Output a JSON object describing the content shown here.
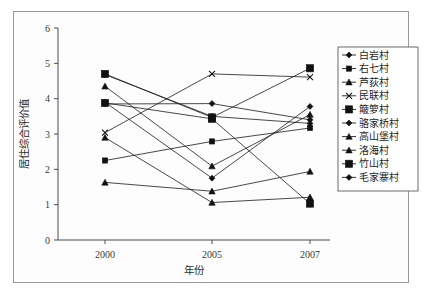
{
  "chart_data": {
    "type": "line",
    "title": "",
    "xlabel": "年份",
    "ylabel": "居住综合评价值",
    "categories": [
      "2000",
      "2005",
      "2007"
    ],
    "x": [
      2000,
      2005,
      2007
    ],
    "xlim": [
      2000,
      2007
    ],
    "ylim": [
      0,
      6
    ],
    "yticks": [
      0,
      1,
      2,
      3,
      4,
      5,
      6
    ],
    "ytick_labels": [
      "0",
      "1",
      "2",
      "3",
      "4",
      "5",
      "6"
    ],
    "grid": false,
    "legend_position": "right",
    "series": [
      {
        "name": "白岩村",
        "marker": "diamond",
        "values": [
          3.85,
          3.86,
          3.4
        ]
      },
      {
        "name": "右七村",
        "marker": "small-square",
        "values": [
          2.25,
          2.79,
          3.17
        ]
      },
      {
        "name": "芦荻村",
        "marker": "triangle",
        "values": [
          4.35,
          2.09,
          3.55
        ]
      },
      {
        "name": "民联村",
        "marker": "cross",
        "values": [
          3.04,
          4.7,
          4.61
        ]
      },
      {
        "name": "簸箩村",
        "marker": "large-square",
        "values": [
          4.7,
          3.47,
          4.86
        ]
      },
      {
        "name": "骆家桥村",
        "marker": "diamond",
        "values": [
          3.9,
          1.75,
          3.78
        ]
      },
      {
        "name": "高山堡村",
        "marker": "triangle",
        "values": [
          2.9,
          1.06,
          1.21
        ]
      },
      {
        "name": "洛海村",
        "marker": "triangle",
        "values": [
          1.63,
          1.38,
          1.94
        ]
      },
      {
        "name": "竹山村",
        "marker": "large-square",
        "values": [
          3.88,
          3.43,
          1.03
        ]
      },
      {
        "name": "毛家寨村",
        "marker": "diamond",
        "values": [
          4.68,
          3.5,
          3.3
        ]
      }
    ]
  },
  "colors": {
    "series_stroke": "#1a1a1a",
    "marker_fill": "#111111",
    "axis": "#4a4a4a",
    "frame": "#9a9a9a",
    "legend_border": "#6b6b6b",
    "background": "#ffffff"
  }
}
